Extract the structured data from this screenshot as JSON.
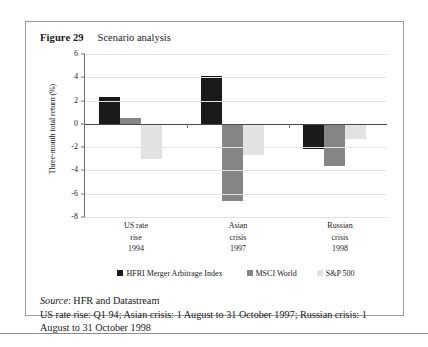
{
  "figure": {
    "label": "Figure 29",
    "title": "Scenario analysis"
  },
  "footer": {
    "source_word": "Source",
    "source_text": ": HFR and Datastream",
    "notes": "US rate rise: Q1 94; Asian crisis: 1 August to 31 October 1997; Russian crisis: 1 August to 31 October 1998"
  },
  "colors": {
    "series1": "#1a1a1a",
    "series2": "#858585",
    "series3": "#e2e2e2",
    "gridline": "#e3e3e3",
    "axis": "#6e6e6e",
    "zeroline": "#4a4a4a",
    "border": "#9a9a9a"
  },
  "chart_data": {
    "type": "bar",
    "title": "Scenario analysis",
    "xlabel": "",
    "ylabel": "Three-month total return (%)",
    "ylim": [
      -8,
      6
    ],
    "yticks": [
      6,
      4,
      2,
      0,
      -2,
      -4,
      -6,
      -8
    ],
    "ytick_labels": [
      "6",
      "4",
      "2",
      "0",
      "-2",
      "-4",
      "-6",
      "-8"
    ],
    "grid": true,
    "legend_position": "bottom",
    "categories": [
      "US rate rise 1994",
      "Asian crisis 1997",
      "Russian crisis 1998"
    ],
    "category_lines": [
      [
        "US rate",
        "rise",
        "1994"
      ],
      [
        "Asian",
        "crisis",
        "1997"
      ],
      [
        "Russian",
        "crisis",
        "1998"
      ]
    ],
    "series": [
      {
        "name": "HFRI Merger Arbitrage Index",
        "color": "#1a1a1a",
        "values": [
          2.3,
          4.1,
          -2.2
        ]
      },
      {
        "name": "MSCI World",
        "color": "#858585",
        "values": [
          0.5,
          -6.6,
          -3.6
        ]
      },
      {
        "name": "S&P 500",
        "color": "#e2e2e2",
        "values": [
          -3.0,
          -2.7,
          -1.3
        ]
      }
    ]
  }
}
